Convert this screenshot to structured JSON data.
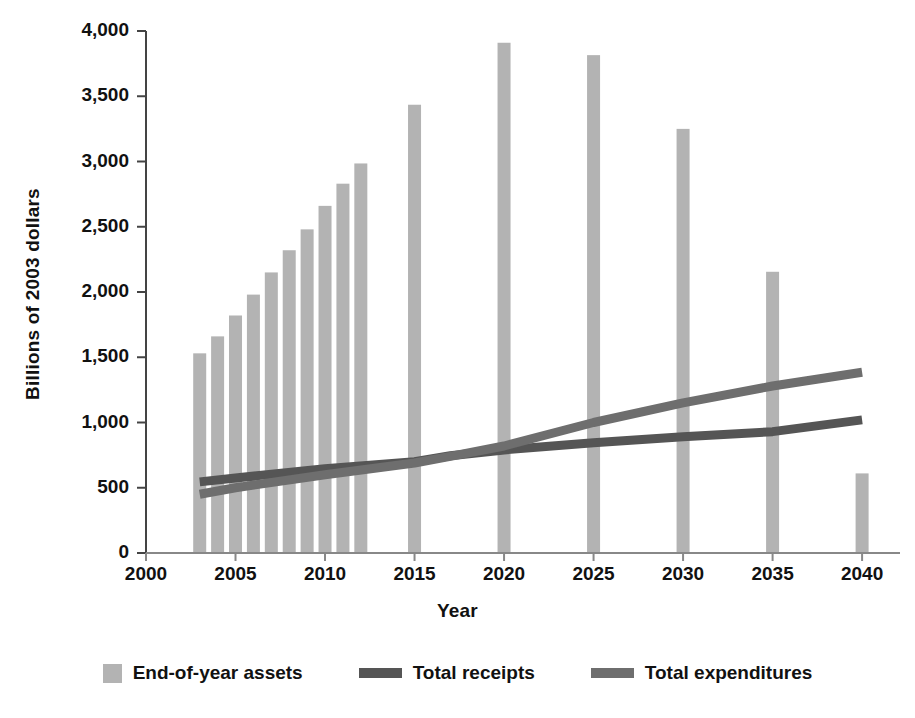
{
  "chart_data": {
    "type": "bar",
    "title": "",
    "xlabel": "Year",
    "ylabel": "Billions of 2003 dollars",
    "xlim": [
      2000,
      2041
    ],
    "ylim": [
      0,
      4000
    ],
    "grid": false,
    "legend_position": "bottom",
    "x_ticks": [
      "2000",
      "2005",
      "2010",
      "2015",
      "2020",
      "2025",
      "2030",
      "2035",
      "2040"
    ],
    "x_tick_values": [
      2000,
      2005,
      2010,
      2015,
      2020,
      2025,
      2030,
      2035,
      2040
    ],
    "y_ticks": [
      "0",
      "500",
      "1,000",
      "1,500",
      "2,000",
      "2,500",
      "3,000",
      "3,500",
      "4,000"
    ],
    "y_tick_values": [
      0,
      500,
      1000,
      1500,
      2000,
      2500,
      3000,
      3500,
      4000
    ],
    "series": [
      {
        "name": "End-of-year assets",
        "kind": "bar",
        "color": "#b3b3b3",
        "x": [
          2003,
          2004,
          2005,
          2006,
          2007,
          2008,
          2009,
          2010,
          2011,
          2012,
          2015,
          2020,
          2025,
          2030,
          2035,
          2040
        ],
        "values": [
          1530,
          1660,
          1820,
          1980,
          2150,
          2320,
          2480,
          2660,
          2830,
          2985,
          3435,
          3910,
          3815,
          3250,
          2155,
          610
        ]
      },
      {
        "name": "Total receipts",
        "kind": "line",
        "color": "#555555",
        "x": [
          2003,
          2005,
          2010,
          2015,
          2017,
          2020,
          2025,
          2030,
          2035,
          2040
        ],
        "values": [
          545,
          575,
          645,
          700,
          745,
          790,
          845,
          890,
          930,
          1020
        ]
      },
      {
        "name": "Total expenditures",
        "kind": "line",
        "color": "#6e6e6e",
        "x": [
          2003,
          2005,
          2010,
          2015,
          2017,
          2020,
          2025,
          2030,
          2035,
          2040
        ],
        "values": [
          450,
          500,
          600,
          690,
          740,
          820,
          1000,
          1150,
          1280,
          1385
        ]
      }
    ]
  },
  "legend": {
    "items": [
      {
        "label": "End-of-year assets",
        "marker": "square",
        "color": "#b3b3b3"
      },
      {
        "label": "Total receipts",
        "marker": "line",
        "color": "#555555"
      },
      {
        "label": "Total expenditures",
        "marker": "line",
        "color": "#6e6e6e"
      }
    ]
  },
  "axes": {
    "y_title": "Billions of 2003 dollars",
    "x_title": "Year"
  }
}
